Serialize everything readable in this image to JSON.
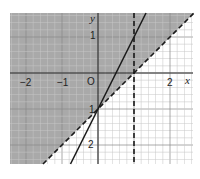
{
  "chart_data": {
    "type": "line",
    "title": "",
    "xlabel": "x",
    "ylabel": "y",
    "xlim": [
      -2.4,
      2.7
    ],
    "ylim": [
      -2.5,
      1.65
    ],
    "grid": true,
    "minor_grid_per_unit": 5,
    "origin_label": "O",
    "x_ticks": [
      {
        "value": -2,
        "label": "−2"
      },
      {
        "value": -1,
        "label": "−1"
      },
      {
        "value": 2,
        "label": "2"
      }
    ],
    "y_ticks": [
      {
        "value": 1,
        "label": "1"
      },
      {
        "value": -1,
        "label": "1"
      },
      {
        "value": -2,
        "label": "2"
      }
    ],
    "series": [
      {
        "name": "y = 2x − 1",
        "style": "solid",
        "slope": 2,
        "intercept": -1,
        "points": [
          [
            -0.76,
            -2.53
          ],
          [
            1.33,
            1.67
          ]
        ]
      },
      {
        "name": "y = x − 1",
        "style": "dashed",
        "slope": 1,
        "intercept": -1,
        "points": [
          [
            -1.53,
            -2.53
          ],
          [
            2.67,
            1.67
          ]
        ]
      },
      {
        "name": "x = 1",
        "style": "dashed",
        "vertical": 1
      }
    ],
    "shaded_region": {
      "description": "half-plane above y = x − 1",
      "color": "#a9a9a9"
    }
  },
  "colors": {
    "shade": "#a9a9a9",
    "grid_minor": "#c8c8c8",
    "grid_major": "#8a8a8a",
    "axis": "#333333",
    "line": "#1a1a1a"
  }
}
